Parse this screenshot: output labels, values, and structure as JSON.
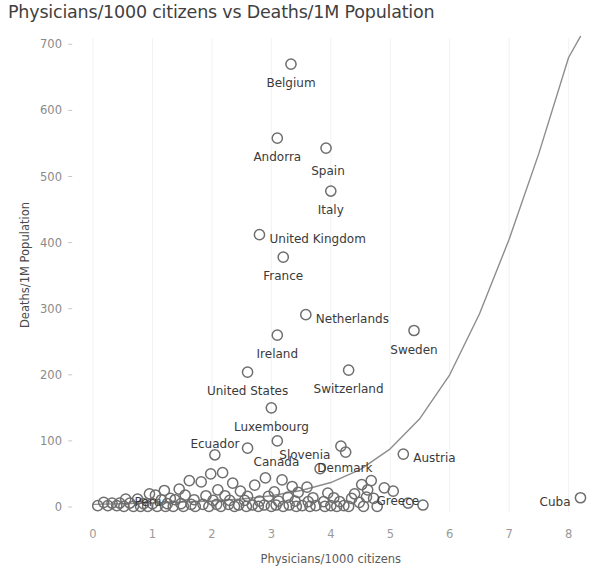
{
  "chart_data": {
    "type": "scatter",
    "title": "Physicians/1000 citizens vs Deaths/1M Population",
    "xlabel": "Physicians/1000 citizens",
    "ylabel": "Deaths/1M Population",
    "xlim": [
      -0.35,
      8.7
    ],
    "ylim": [
      -18,
      715
    ],
    "xticks": [
      0,
      1,
      2,
      3,
      4,
      5,
      6,
      7,
      8
    ],
    "yticks": [
      0,
      100,
      200,
      300,
      400,
      500,
      600,
      700
    ],
    "grid": "faint vertical gridlines only",
    "legend": "none",
    "marker_style": "hollow circle, gray outline",
    "marker_color": "#6e6e6e",
    "trend_line": {
      "type": "exponential",
      "color": "#8d8d8d",
      "description": "exponential trend curve rising steeply after x=4",
      "points": [
        {
          "x": 0.0,
          "y": 4
        },
        {
          "x": 1.0,
          "y": 6
        },
        {
          "x": 2.0,
          "y": 9
        },
        {
          "x": 2.5,
          "y": 12
        },
        {
          "x": 3.0,
          "y": 17
        },
        {
          "x": 3.5,
          "y": 25
        },
        {
          "x": 4.0,
          "y": 37
        },
        {
          "x": 4.5,
          "y": 57
        },
        {
          "x": 5.0,
          "y": 88
        },
        {
          "x": 5.5,
          "y": 134
        },
        {
          "x": 6.0,
          "y": 200
        },
        {
          "x": 6.5,
          "y": 292
        },
        {
          "x": 7.0,
          "y": 405
        },
        {
          "x": 7.5,
          "y": 535
        },
        {
          "x": 8.0,
          "y": 680
        },
        {
          "x": 8.2,
          "y": 712
        }
      ]
    },
    "labeled_points": [
      {
        "label": "Belgium",
        "x": 3.33,
        "y": 670,
        "label_anchor": "middle",
        "dx": 0,
        "dy": 19
      },
      {
        "label": "Andorra",
        "x": 3.1,
        "y": 558,
        "label_anchor": "middle",
        "dx": 0,
        "dy": 19
      },
      {
        "label": "Spain",
        "x": 3.92,
        "y": 543,
        "label_anchor": "middle",
        "dx": 2,
        "dy": 23
      },
      {
        "label": "Italy",
        "x": 4.0,
        "y": 478,
        "label_anchor": "middle",
        "dx": 0,
        "dy": 19
      },
      {
        "label": "United Kingdom",
        "x": 2.8,
        "y": 412,
        "label_anchor": "start",
        "dx": 10,
        "dy": 4
      },
      {
        "label": "France",
        "x": 3.2,
        "y": 378,
        "label_anchor": "middle",
        "dx": 0,
        "dy": 19
      },
      {
        "label": "Netherlands",
        "x": 3.58,
        "y": 291,
        "label_anchor": "start",
        "dx": 10,
        "dy": 4
      },
      {
        "label": "Ireland",
        "x": 3.1,
        "y": 260,
        "label_anchor": "middle",
        "dx": 0,
        "dy": 19
      },
      {
        "label": "Sweden",
        "x": 5.4,
        "y": 267,
        "label_anchor": "middle",
        "dx": 0,
        "dy": 19
      },
      {
        "label": "United States",
        "x": 2.6,
        "y": 204,
        "label_anchor": "middle",
        "dx": 0,
        "dy": 19
      },
      {
        "label": "Switzerland",
        "x": 4.3,
        "y": 207,
        "label_anchor": "middle",
        "dx": 0,
        "dy": 19
      },
      {
        "label": "Luxembourg",
        "x": 3.0,
        "y": 150,
        "label_anchor": "middle",
        "dx": 0,
        "dy": 19
      },
      {
        "label": "Ecuador",
        "x": 2.05,
        "y": 79,
        "label_anchor": "middle",
        "dx": 0,
        "dy": -11
      },
      {
        "label": "Canada",
        "x": 2.6,
        "y": 89,
        "label_anchor": "start",
        "dx": 6,
        "dy": 14
      },
      {
        "label": "Slovenia",
        "x": 3.1,
        "y": 100,
        "label_anchor": "start",
        "dx": 2,
        "dy": 14
      },
      {
        "label": "Denmark",
        "x": 4.17,
        "y": 92,
        "label_anchor": "middle",
        "dx": 4,
        "dy": 22
      },
      {
        "label": "Austria",
        "x": 5.22,
        "y": 80,
        "label_anchor": "start",
        "dx": 10,
        "dy": 4
      },
      {
        "label": "Peru",
        "x": 1.3,
        "y": 13,
        "label_anchor": "end",
        "dx": -9,
        "dy": 4
      },
      {
        "label": "Greece",
        "x": 4.6,
        "y": 15,
        "label_anchor": "start",
        "dx": 10,
        "dy": 4
      },
      {
        "label": "Cuba",
        "x": 8.2,
        "y": 14,
        "label_anchor": "end",
        "dx": -10,
        "dy": 4
      }
    ],
    "unlabeled_points": [
      {
        "x": 4.25,
        "y": 83
      },
      {
        "x": 3.82,
        "y": 58
      },
      {
        "x": 2.9,
        "y": 44
      },
      {
        "x": 1.62,
        "y": 40
      },
      {
        "x": 1.82,
        "y": 38
      },
      {
        "x": 2.35,
        "y": 36
      },
      {
        "x": 2.72,
        "y": 33
      },
      {
        "x": 3.35,
        "y": 31
      },
      {
        "x": 3.6,
        "y": 30
      },
      {
        "x": 4.52,
        "y": 34
      },
      {
        "x": 4.9,
        "y": 29
      },
      {
        "x": 5.05,
        "y": 24
      },
      {
        "x": 1.45,
        "y": 27
      },
      {
        "x": 1.2,
        "y": 25
      },
      {
        "x": 2.1,
        "y": 26
      },
      {
        "x": 2.48,
        "y": 24
      },
      {
        "x": 3.05,
        "y": 23
      },
      {
        "x": 3.45,
        "y": 22
      },
      {
        "x": 3.95,
        "y": 21
      },
      {
        "x": 4.4,
        "y": 20
      },
      {
        "x": 0.95,
        "y": 20
      },
      {
        "x": 1.05,
        "y": 18
      },
      {
        "x": 1.55,
        "y": 18
      },
      {
        "x": 1.9,
        "y": 17
      },
      {
        "x": 2.22,
        "y": 17
      },
      {
        "x": 2.6,
        "y": 16
      },
      {
        "x": 2.95,
        "y": 16
      },
      {
        "x": 3.28,
        "y": 15
      },
      {
        "x": 3.7,
        "y": 14
      },
      {
        "x": 4.05,
        "y": 14
      },
      {
        "x": 4.35,
        "y": 13
      },
      {
        "x": 4.72,
        "y": 13
      },
      {
        "x": 0.55,
        "y": 12
      },
      {
        "x": 0.75,
        "y": 12
      },
      {
        "x": 1.15,
        "y": 11
      },
      {
        "x": 1.38,
        "y": 11
      },
      {
        "x": 1.7,
        "y": 11
      },
      {
        "x": 2.02,
        "y": 10
      },
      {
        "x": 2.3,
        "y": 10
      },
      {
        "x": 2.55,
        "y": 10
      },
      {
        "x": 2.8,
        "y": 9
      },
      {
        "x": 3.12,
        "y": 9
      },
      {
        "x": 3.4,
        "y": 9
      },
      {
        "x": 3.62,
        "y": 8
      },
      {
        "x": 3.88,
        "y": 8
      },
      {
        "x": 4.15,
        "y": 8
      },
      {
        "x": 4.48,
        "y": 7
      },
      {
        "x": 0.18,
        "y": 7
      },
      {
        "x": 0.32,
        "y": 6
      },
      {
        "x": 0.45,
        "y": 6
      },
      {
        "x": 0.62,
        "y": 6
      },
      {
        "x": 0.85,
        "y": 5
      },
      {
        "x": 1.0,
        "y": 5
      },
      {
        "x": 1.25,
        "y": 5
      },
      {
        "x": 1.48,
        "y": 5
      },
      {
        "x": 1.65,
        "y": 4
      },
      {
        "x": 1.85,
        "y": 4
      },
      {
        "x": 2.08,
        "y": 4
      },
      {
        "x": 2.28,
        "y": 4
      },
      {
        "x": 2.45,
        "y": 3
      },
      {
        "x": 2.68,
        "y": 3
      },
      {
        "x": 2.88,
        "y": 3
      },
      {
        "x": 3.08,
        "y": 3
      },
      {
        "x": 3.3,
        "y": 3
      },
      {
        "x": 3.52,
        "y": 2
      },
      {
        "x": 3.75,
        "y": 2
      },
      {
        "x": 4.0,
        "y": 2
      },
      {
        "x": 4.22,
        "y": 2
      },
      {
        "x": 0.08,
        "y": 2
      },
      {
        "x": 0.25,
        "y": 2
      },
      {
        "x": 0.4,
        "y": 2
      },
      {
        "x": 0.52,
        "y": 1
      },
      {
        "x": 0.68,
        "y": 1
      },
      {
        "x": 0.8,
        "y": 1
      },
      {
        "x": 0.92,
        "y": 1
      },
      {
        "x": 1.08,
        "y": 1
      },
      {
        "x": 1.22,
        "y": 1
      },
      {
        "x": 1.35,
        "y": 1
      },
      {
        "x": 1.52,
        "y": 1
      },
      {
        "x": 1.72,
        "y": 1
      },
      {
        "x": 1.95,
        "y": 1
      },
      {
        "x": 2.15,
        "y": 1
      },
      {
        "x": 2.38,
        "y": 1
      },
      {
        "x": 2.58,
        "y": 1
      },
      {
        "x": 2.78,
        "y": 1
      },
      {
        "x": 3.0,
        "y": 1
      },
      {
        "x": 3.2,
        "y": 1
      },
      {
        "x": 3.42,
        "y": 1
      },
      {
        "x": 3.65,
        "y": 1
      },
      {
        "x": 3.9,
        "y": 1
      },
      {
        "x": 4.1,
        "y": 1
      },
      {
        "x": 4.3,
        "y": 1
      },
      {
        "x": 4.55,
        "y": 1
      },
      {
        "x": 4.78,
        "y": 1
      },
      {
        "x": 5.3,
        "y": 6
      },
      {
        "x": 5.55,
        "y": 3
      },
      {
        "x": 2.18,
        "y": 52
      },
      {
        "x": 1.98,
        "y": 50
      },
      {
        "x": 3.18,
        "y": 41
      },
      {
        "x": 4.62,
        "y": 26
      },
      {
        "x": 4.68,
        "y": 40
      }
    ]
  }
}
